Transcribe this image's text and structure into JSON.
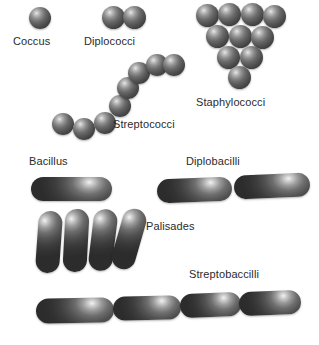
{
  "diagram": {
    "background_color": "#ffffff",
    "width": 319,
    "height": 345
  },
  "labels": {
    "coccus": "Coccus",
    "diplococci": "Diplococci",
    "staphylococci": "Staphylococci",
    "streptococci": "Streptococci",
    "bacillus": "Bacillus",
    "diplobacilli": "Diplobacilli",
    "palisades": "Palisades",
    "streptobacilli": "Streptobaccilli"
  },
  "colors": {
    "cell_highlight": "#f2f2f2",
    "cell_midtone": "#6e6e6e",
    "cell_shadow": "#2c2c2c",
    "label_text": "#2b2b2b",
    "background": "#ffffff"
  },
  "groups": [
    {
      "name": "coccus",
      "cell_shape": "sphere",
      "arrangement": "single",
      "cell_count": 1,
      "label": "Coccus"
    },
    {
      "name": "diplococci",
      "cell_shape": "sphere",
      "arrangement": "pair",
      "cell_count": 2,
      "label": "Diplococci"
    },
    {
      "name": "staphylococci",
      "cell_shape": "sphere",
      "arrangement": "grape-like cluster",
      "cell_count": 10,
      "label": "Staphylococci"
    },
    {
      "name": "streptococci",
      "cell_shape": "sphere",
      "arrangement": "chain",
      "cell_count": 7,
      "label": "Streptococci"
    },
    {
      "name": "bacillus",
      "cell_shape": "rod",
      "arrangement": "single",
      "cell_count": 1,
      "label": "Bacillus"
    },
    {
      "name": "diplobacilli",
      "cell_shape": "rod",
      "arrangement": "pair",
      "cell_count": 2,
      "label": "Diplobacilli"
    },
    {
      "name": "palisades",
      "cell_shape": "rod",
      "arrangement": "side-by-side palisade",
      "cell_count": 4,
      "label": "Palisades"
    },
    {
      "name": "streptobacilli",
      "cell_shape": "rod",
      "arrangement": "chain",
      "cell_count": 4,
      "label": "Streptobaccilli"
    }
  ]
}
